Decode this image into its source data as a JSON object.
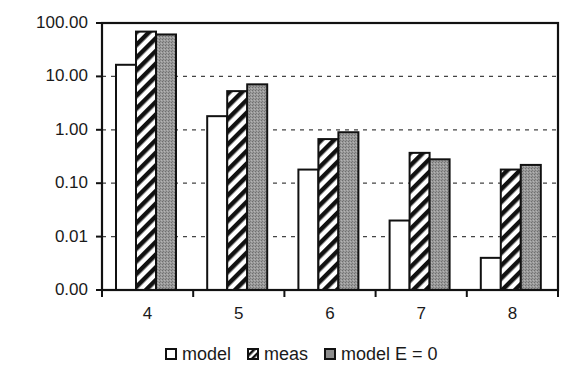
{
  "chart_data": {
    "type": "bar",
    "title": "",
    "xlabel": "",
    "ylabel": "",
    "yscale": "log",
    "ylim": [
      0.001,
      100
    ],
    "yticks": [
      0.001,
      0.01,
      0.1,
      1,
      10,
      100
    ],
    "ytick_labels": [
      "0.00",
      "0.01",
      "0.10",
      "1.00",
      "10.00",
      "100.00"
    ],
    "grid": "horizontal dashed",
    "legend_position": "bottom",
    "categories": [
      "4",
      "5",
      "6",
      "7",
      "8"
    ],
    "series": [
      {
        "name": "model",
        "fill": "white",
        "values": [
          16.5,
          1.8,
          0.18,
          0.02,
          0.004
        ]
      },
      {
        "name": "meas",
        "fill": "hatched",
        "values": [
          69,
          5.3,
          0.67,
          0.37,
          0.18
        ]
      },
      {
        "name": "model E = 0",
        "fill": "gray",
        "values": [
          61,
          7.1,
          0.9,
          0.28,
          0.22
        ]
      }
    ]
  },
  "legend": {
    "items": [
      {
        "label": "model"
      },
      {
        "label": "meas"
      },
      {
        "label": "model E = 0"
      }
    ]
  },
  "colors": {
    "axis": "#111111",
    "grid": "#444444",
    "bar_outline": "#111111",
    "model_fill": "#ffffff",
    "e0_fill": "#8c8c8c"
  }
}
